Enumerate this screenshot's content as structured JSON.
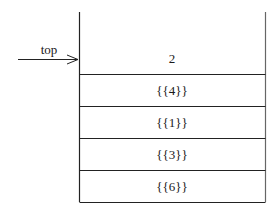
{
  "diagram": {
    "type": "stack",
    "pointer_label": "top",
    "top_value": "2",
    "cells": [
      "{{4}}",
      "{{1}}",
      "{{3}}",
      "{{6}}"
    ]
  }
}
